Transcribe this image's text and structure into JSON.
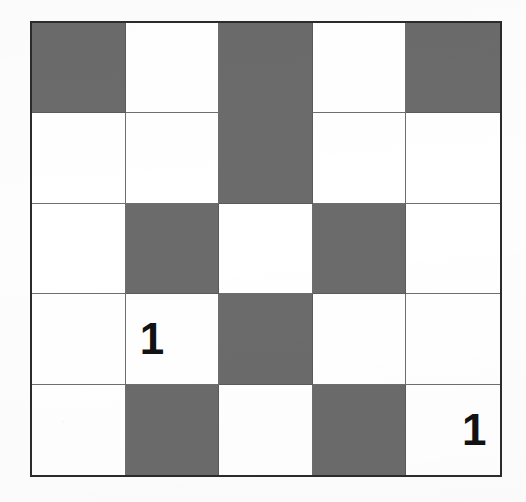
{
  "puzzle": {
    "title": "5x5 Shaded Grid Puzzle",
    "rows": 5,
    "columns": 5,
    "colors": {
      "filled": "#6b6b6b",
      "empty": "#ffffff",
      "outer_border": "#2b2b2b",
      "inner_line": "#6e6e6e",
      "label_text": "#121212",
      "page_background": "#fdfdfd"
    },
    "legend": {
      "filled_name": "shaded-cell",
      "empty_name": "empty-cell"
    },
    "cells": [
      [
        {
          "row": 1,
          "col": 1,
          "state": "filled",
          "label": "",
          "align": "center"
        },
        {
          "row": 1,
          "col": 2,
          "state": "empty",
          "label": "",
          "align": "center"
        },
        {
          "row": 1,
          "col": 3,
          "state": "filled",
          "label": "",
          "align": "center"
        },
        {
          "row": 1,
          "col": 4,
          "state": "empty",
          "label": "",
          "align": "center"
        },
        {
          "row": 1,
          "col": 5,
          "state": "filled",
          "label": "",
          "align": "center"
        }
      ],
      [
        {
          "row": 2,
          "col": 1,
          "state": "empty",
          "label": "",
          "align": "center"
        },
        {
          "row": 2,
          "col": 2,
          "state": "empty",
          "label": "",
          "align": "center"
        },
        {
          "row": 2,
          "col": 3,
          "state": "filled",
          "label": "",
          "align": "center"
        },
        {
          "row": 2,
          "col": 4,
          "state": "empty",
          "label": "",
          "align": "center"
        },
        {
          "row": 2,
          "col": 5,
          "state": "empty",
          "label": "",
          "align": "center"
        }
      ],
      [
        {
          "row": 3,
          "col": 1,
          "state": "empty",
          "label": "",
          "align": "center"
        },
        {
          "row": 3,
          "col": 2,
          "state": "filled",
          "label": "",
          "align": "center"
        },
        {
          "row": 3,
          "col": 3,
          "state": "empty",
          "label": "",
          "align": "center"
        },
        {
          "row": 3,
          "col": 4,
          "state": "filled",
          "label": "",
          "align": "center"
        },
        {
          "row": 3,
          "col": 5,
          "state": "empty",
          "label": "",
          "align": "center"
        }
      ],
      [
        {
          "row": 4,
          "col": 1,
          "state": "empty",
          "label": "",
          "align": "center"
        },
        {
          "row": 4,
          "col": 2,
          "state": "empty",
          "label": "1",
          "align": "left"
        },
        {
          "row": 4,
          "col": 3,
          "state": "filled",
          "label": "",
          "align": "center"
        },
        {
          "row": 4,
          "col": 4,
          "state": "empty",
          "label": "",
          "align": "center"
        },
        {
          "row": 4,
          "col": 5,
          "state": "empty",
          "label": "",
          "align": "center"
        }
      ],
      [
        {
          "row": 5,
          "col": 1,
          "state": "empty",
          "label": "",
          "align": "center"
        },
        {
          "row": 5,
          "col": 2,
          "state": "filled",
          "label": "",
          "align": "center"
        },
        {
          "row": 5,
          "col": 3,
          "state": "empty",
          "label": "",
          "align": "center"
        },
        {
          "row": 5,
          "col": 4,
          "state": "filled",
          "label": "",
          "align": "center"
        },
        {
          "row": 5,
          "col": 5,
          "state": "empty",
          "label": "1",
          "align": "right"
        }
      ]
    ]
  }
}
